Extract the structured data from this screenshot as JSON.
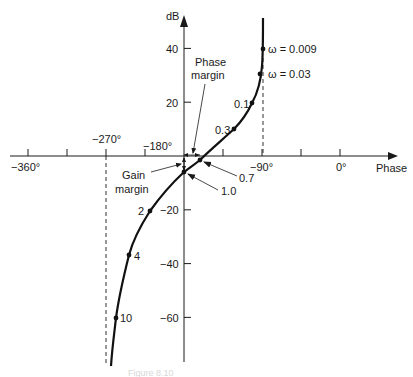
{
  "chart_data": {
    "type": "line",
    "xlabel": "Phase",
    "ylabel": "dB",
    "xlim": [
      -360,
      0
    ],
    "ylim": [
      -80,
      50
    ],
    "grid": false,
    "x_ticks": [
      -360,
      -315,
      -270,
      -225,
      -180,
      -135,
      -90,
      -45,
      0
    ],
    "x_tick_labels": [
      {
        "value": -360,
        "label": "−360°"
      },
      {
        "value": -270,
        "label": "−270°"
      },
      {
        "value": -180,
        "label": "−180°"
      },
      {
        "value": -90,
        "label": "−90°"
      },
      {
        "value": 0,
        "label": "0°"
      }
    ],
    "y_tick_labels": [
      {
        "value": 40,
        "label": "40"
      },
      {
        "value": 20,
        "label": "20"
      },
      {
        "value": -20,
        "label": "−20"
      },
      {
        "value": -40,
        "label": "−40"
      },
      {
        "value": -60,
        "label": "−60"
      }
    ],
    "series": [
      {
        "name": "open-loop frequency response",
        "points": [
          {
            "omega": 0.009,
            "label": "ω = 0.009",
            "phase": -90,
            "db": 40
          },
          {
            "omega": 0.03,
            "label": "ω = 0.03",
            "phase": -93,
            "db": 30.5
          },
          {
            "omega": 0.1,
            "label": "0.1",
            "phase": -103,
            "db": 20
          },
          {
            "omega": 0.3,
            "label": "0.3",
            "phase": -123,
            "db": 10
          },
          {
            "omega": 0.7,
            "label": "0.7",
            "phase": -161,
            "db": -1.5
          },
          {
            "omega": 1.0,
            "label": "1.0",
            "phase": -180,
            "db": -6
          },
          {
            "omega": 2,
            "label": "2",
            "phase": -219,
            "db": -20
          },
          {
            "omega": 4,
            "label": "4",
            "phase": -243,
            "db": -36.5
          },
          {
            "omega": 10,
            "label": "10",
            "phase": -258,
            "db": -60
          }
        ]
      }
    ],
    "asymptotes": [
      {
        "phase": -270,
        "style": "dashed"
      },
      {
        "phase": -90,
        "style": "dashed"
      }
    ],
    "annotations": [
      {
        "text": "Phase margin",
        "lines": [
          "Phase",
          "margin"
        ]
      },
      {
        "text": "Gain margin",
        "lines": [
          "Gain",
          "margin"
        ]
      }
    ]
  },
  "axes": {
    "y_label": "dB",
    "x_label": "Phase"
  },
  "annotations": {
    "phase_margin_line1": "Phase",
    "phase_margin_line2": "margin",
    "gain_margin_line1": "Gain",
    "gain_margin_line2": "margin"
  },
  "caption": "Figure 8.10"
}
